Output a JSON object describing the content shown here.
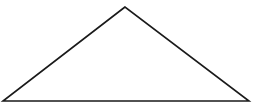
{
  "diagram": {
    "type": "triangle",
    "stroke_color": "#1a1a1a",
    "fill_color": "#ffffff",
    "vertices": {
      "apex": [
        125,
        7
      ],
      "left": [
        3,
        101
      ],
      "right": [
        249,
        101
      ]
    }
  },
  "caption": {
    "text": "",
    "note": "cropped"
  }
}
